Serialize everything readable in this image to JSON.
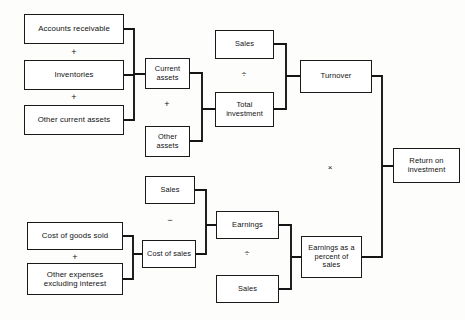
{
  "diagram": {
    "nodes": [
      {
        "id": "accounts-receivable",
        "label": "Accounts receivable",
        "x": 24,
        "y": 14,
        "w": 100,
        "h": 30,
        "fs": 7.8
      },
      {
        "id": "inventories",
        "label": "Inventories",
        "x": 24,
        "y": 60,
        "w": 100,
        "h": 30,
        "fs": 7.8
      },
      {
        "id": "other-current-assets",
        "label": "Other current  assets",
        "x": 24,
        "y": 105,
        "w": 100,
        "h": 30,
        "fs": 7.8
      },
      {
        "id": "current-assets",
        "label": "Current\nassets",
        "x": 145,
        "y": 58,
        "w": 45,
        "h": 31,
        "fs": 7.4
      },
      {
        "id": "other-assets",
        "label": "Other\nassets",
        "x": 145,
        "y": 126,
        "w": 45,
        "h": 31,
        "fs": 7.4
      },
      {
        "id": "sales-top",
        "label": "Sales",
        "x": 215,
        "y": 30,
        "w": 59,
        "h": 29,
        "fs": 7.4
      },
      {
        "id": "total-investment",
        "label": "Total\ninvestment",
        "x": 215,
        "y": 92,
        "w": 59,
        "h": 35,
        "fs": 7.4
      },
      {
        "id": "turnover",
        "label": "Turnover",
        "x": 300,
        "y": 60,
        "w": 72,
        "h": 33,
        "fs": 7.6
      },
      {
        "id": "return-on-investment",
        "label": "Return on\ninvestment",
        "x": 393,
        "y": 148,
        "w": 67,
        "h": 35,
        "fs": 7.6
      },
      {
        "id": "sales-mid",
        "label": "Sales",
        "x": 145,
        "y": 176,
        "w": 50,
        "h": 28,
        "fs": 7.4
      },
      {
        "id": "cost-of-sales",
        "label": "Cost of sales",
        "x": 142,
        "y": 240,
        "w": 54,
        "h": 28,
        "fs": 7.4
      },
      {
        "id": "cost-of-goods-sold",
        "label": "Cost of goods sold",
        "x": 27,
        "y": 222,
        "w": 96,
        "h": 28,
        "fs": 7.8
      },
      {
        "id": "other-expenses",
        "label": "Other expenses\nexcluding interest",
        "x": 27,
        "y": 263,
        "w": 96,
        "h": 32,
        "fs": 7.8
      },
      {
        "id": "earnings",
        "label": "Earnings",
        "x": 216,
        "y": 211,
        "w": 63,
        "h": 28,
        "fs": 7.6
      },
      {
        "id": "sales-bottom",
        "label": "Sales",
        "x": 216,
        "y": 275,
        "w": 63,
        "h": 28,
        "fs": 7.4
      },
      {
        "id": "earnings-percent-sales",
        "label": "Earnings as a\npercent of\nsales",
        "x": 301,
        "y": 236,
        "w": 61,
        "h": 42,
        "fs": 7.4
      }
    ],
    "operators": [
      {
        "id": "plus-ar-inv",
        "symbol": "+",
        "x": 66,
        "y": 44,
        "w": 16,
        "h": 16,
        "fs": 9
      },
      {
        "id": "plus-inv-oca",
        "symbol": "+",
        "x": 66,
        "y": 89,
        "w": 16,
        "h": 16,
        "fs": 9
      },
      {
        "id": "plus-ca-oa",
        "symbol": "+",
        "x": 159,
        "y": 96,
        "w": 16,
        "h": 16,
        "fs": 9
      },
      {
        "id": "divide-sales-ti",
        "symbol": "÷",
        "x": 236,
        "y": 66,
        "w": 16,
        "h": 16,
        "fs": 9
      },
      {
        "id": "multiply-turnover",
        "symbol": "×",
        "x": 322,
        "y": 159,
        "w": 16,
        "h": 16,
        "fs": 8
      },
      {
        "id": "minus-sales-cos",
        "symbol": "−",
        "x": 162,
        "y": 212,
        "w": 16,
        "h": 16,
        "fs": 9
      },
      {
        "id": "plus-cogs-oe",
        "symbol": "+",
        "x": 67,
        "y": 249,
        "w": 16,
        "h": 16,
        "fs": 9
      },
      {
        "id": "divide-earn-sales",
        "symbol": "÷",
        "x": 239,
        "y": 245,
        "w": 16,
        "h": 16,
        "fs": 9
      }
    ],
    "connectors": [
      {
        "id": "wire-current-assets-inputs",
        "d": "M124 29 L134 29 L134 74 M124 75 L134 75 M124 120 L134 120 L134 74 M134 74 L145 74"
      },
      {
        "id": "wire-total-investment-inputs",
        "d": "M190 73 L202 73 L202 109 M190 141 L202 141 L202 109 M202 109 L215 109"
      },
      {
        "id": "wire-turnover-inputs",
        "d": "M274 44 L286 44 L286 76 M274 109 L286 109 L286 76 M286 76 L300 76"
      },
      {
        "id": "wire-roi-inputs",
        "d": "M372 76 L382 76 L382 166 M362 257 L382 257 L382 166 M382 166 L393 166"
      },
      {
        "id": "wire-cost-of-sales-inputs",
        "d": "M123 236 L133 236 L133 254 M123 279 L133 279 L133 254 M133 254 L142 254"
      },
      {
        "id": "wire-earnings-inputs",
        "d": "M195 190 L206 190 L206 225 M196 254 L206 254 L206 225 M206 225 L216 225"
      },
      {
        "id": "wire-epsales-inputs",
        "d": "M279 225 L291 225 L291 257 M279 289 L291 289 L291 257 M291 257 L301 257"
      }
    ]
  }
}
